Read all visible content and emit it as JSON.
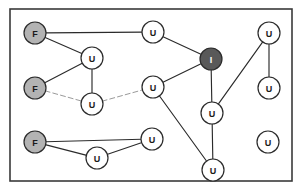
{
  "figure": {
    "canvas": {
      "width": 303,
      "height": 190
    },
    "frame": {
      "x": 10,
      "y": 9,
      "width": 282,
      "height": 172,
      "stroke": "#3a3a3a",
      "fill": "#ffffff",
      "stroke_width": 1.6
    }
  },
  "legend": {
    "state_labels": {
      "F": "F",
      "U": "U",
      "I": "I"
    }
  },
  "colors": {
    "node_stroke": "#2b2b2b",
    "node_fill_unknown": "#ffffff",
    "node_fill_failed": "#b3b3b3",
    "node_fill_infected": "#595959",
    "label_dark": "#1a1a1a",
    "label_light": "#ffffff",
    "edge_solid": "#2b2b2b",
    "edge_faint": "#9a9a9a",
    "background": "#ffffff"
  },
  "graph": {
    "node_radius": 11,
    "nodes": [
      {
        "id": "f1",
        "label": "F",
        "state": "failed",
        "x": 35,
        "y": 33
      },
      {
        "id": "u1",
        "label": "U",
        "state": "unknown",
        "x": 153,
        "y": 32
      },
      {
        "id": "u2",
        "label": "U",
        "state": "unknown",
        "x": 269,
        "y": 33
      },
      {
        "id": "u3",
        "label": "U",
        "state": "unknown",
        "x": 92,
        "y": 58
      },
      {
        "id": "i1",
        "label": "I",
        "state": "infected",
        "x": 211,
        "y": 59
      },
      {
        "id": "f2",
        "label": "F",
        "state": "failed",
        "x": 35,
        "y": 88
      },
      {
        "id": "u4",
        "label": "U",
        "state": "unknown",
        "x": 153,
        "y": 87
      },
      {
        "id": "u5",
        "label": "U",
        "state": "unknown",
        "x": 269,
        "y": 88
      },
      {
        "id": "u6",
        "label": "U",
        "state": "unknown",
        "x": 92,
        "y": 104
      },
      {
        "id": "u7",
        "label": "U",
        "state": "unknown",
        "x": 212,
        "y": 113
      },
      {
        "id": "f3",
        "label": "F",
        "state": "failed",
        "x": 35,
        "y": 142
      },
      {
        "id": "u8",
        "label": "U",
        "state": "unknown",
        "x": 152,
        "y": 139
      },
      {
        "id": "u9",
        "label": "U",
        "state": "unknown",
        "x": 268,
        "y": 142
      },
      {
        "id": "u10",
        "label": "U",
        "state": "unknown",
        "x": 97,
        "y": 158
      },
      {
        "id": "u11",
        "label": "U",
        "state": "unknown",
        "x": 213,
        "y": 170
      }
    ],
    "edges": [
      {
        "from": "f1",
        "to": "u1",
        "style": "solid"
      },
      {
        "from": "f1",
        "to": "u3",
        "style": "solid"
      },
      {
        "from": "u1",
        "to": "i1",
        "style": "solid"
      },
      {
        "from": "u3",
        "to": "f2",
        "style": "solid"
      },
      {
        "from": "u3",
        "to": "u6",
        "style": "solid"
      },
      {
        "from": "f2",
        "to": "u6",
        "style": "faint"
      },
      {
        "from": "u6",
        "to": "u4",
        "style": "faint"
      },
      {
        "from": "u4",
        "to": "i1",
        "style": "solid"
      },
      {
        "from": "u4",
        "to": "u11",
        "style": "solid"
      },
      {
        "from": "i1",
        "to": "u7",
        "style": "solid"
      },
      {
        "from": "u2",
        "to": "u5",
        "style": "solid"
      },
      {
        "from": "u2",
        "to": "u7",
        "style": "solid"
      },
      {
        "from": "u7",
        "to": "u11",
        "style": "solid"
      },
      {
        "from": "f3",
        "to": "u8",
        "style": "solid"
      },
      {
        "from": "f3",
        "to": "u10",
        "style": "solid"
      },
      {
        "from": "u10",
        "to": "u8",
        "style": "solid"
      }
    ]
  }
}
